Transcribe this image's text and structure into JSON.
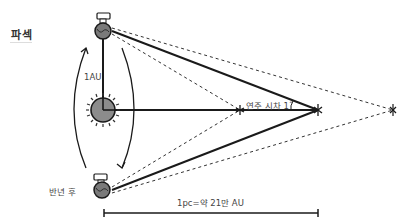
{
  "title": "파섹",
  "labels": {
    "distance_1au": "1AU",
    "parallax": "연주 시차 1˝",
    "half_year_later": "반년 후",
    "parsec_definition": "1pc=약 21만 AU"
  },
  "colors": {
    "line": "#1a1a1a",
    "sun_fill": "#8c8c8c",
    "earth_fill": "#7a7a7a",
    "text": "#444444"
  }
}
